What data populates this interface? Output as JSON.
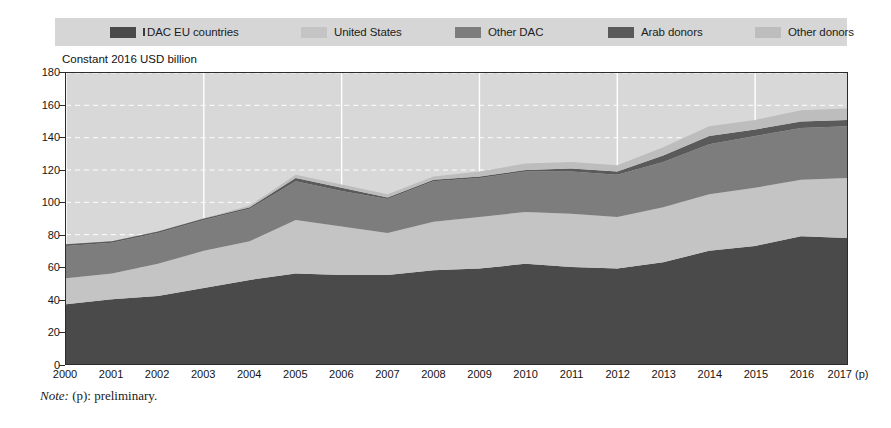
{
  "legend": {
    "background_color": "#d6d6d6",
    "items": [
      {
        "label": "DAC EU countries",
        "color": "#4a4a4a",
        "prefix_tick": true
      },
      {
        "label": "United States",
        "color": "#c4c4c4",
        "prefix_tick": false
      },
      {
        "label": "Other DAC",
        "color": "#7d7d7d",
        "prefix_tick": false
      },
      {
        "label": "Arab donors",
        "color": "#5a5a5a",
        "prefix_tick": false
      },
      {
        "label": "Other donors",
        "color": "#bdbdbd",
        "prefix_tick": false
      }
    ]
  },
  "axis_title": "Constant 2016 USD billion",
  "note": {
    "prefix": "Note:",
    "text": " (p): preliminary."
  },
  "chart_data": {
    "type": "area",
    "stacked": true,
    "title": "",
    "subtitle": "",
    "xlabel": "",
    "ylabel": "Constant 2016 USD billion",
    "ylim": [
      0,
      180
    ],
    "ytick_step": 20,
    "yticks": [
      0,
      20,
      40,
      60,
      80,
      100,
      120,
      140,
      160,
      180
    ],
    "grid": true,
    "grid_color": "#ffffff",
    "plot_background": "#d8d8d8",
    "legend_position": "top",
    "categories": [
      "2000",
      "2001",
      "2002",
      "2003",
      "2004",
      "2005",
      "2006",
      "2007",
      "2008",
      "2009",
      "2010",
      "2011",
      "2012",
      "2013",
      "2014",
      "2015",
      "2016",
      "2017 (p)"
    ],
    "series": [
      {
        "name": "DAC EU countries",
        "color": "#4a4a4a",
        "values": [
          37,
          40,
          42,
          47,
          52,
          56,
          55,
          55,
          58,
          59,
          62,
          60,
          59,
          63,
          70,
          73,
          79,
          78
        ]
      },
      {
        "name": "United States",
        "color": "#c4c4c4",
        "values": [
          16,
          16,
          20,
          23,
          24,
          33,
          30,
          26,
          30,
          32,
          32,
          33,
          32,
          34,
          35,
          36,
          35,
          37
        ]
      },
      {
        "name": "Other DAC",
        "color": "#7d7d7d",
        "values": [
          20,
          19,
          19,
          19,
          20,
          24,
          22,
          21,
          25,
          24,
          25,
          26,
          26,
          28,
          31,
          32,
          32,
          32
        ]
      },
      {
        "name": "Arab donors",
        "color": "#5a5a5a",
        "values": [
          1,
          1,
          1,
          1,
          1,
          2,
          2,
          1,
          1,
          1,
          1,
          2,
          2,
          4,
          5,
          4,
          4,
          4
        ]
      },
      {
        "name": "Other donors",
        "color": "#bdbdbd",
        "values": [
          0,
          0,
          0,
          0,
          1,
          2,
          2,
          2,
          2,
          3,
          4,
          4,
          4,
          5,
          6,
          6,
          7,
          7
        ]
      }
    ],
    "totals": [
      74,
      76,
      82,
      90,
      98,
      117,
      111,
      105,
      116,
      119,
      124,
      125,
      123,
      134,
      147,
      151,
      157,
      158
    ]
  }
}
